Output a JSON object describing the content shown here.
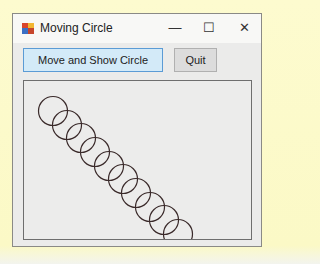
{
  "window": {
    "title": "Moving Circle",
    "controls": {
      "minimize": "—",
      "maximize": "☐",
      "close": "✕"
    }
  },
  "buttons": {
    "move_label": "Move and Show Circle",
    "quit_label": "Quit"
  },
  "canvas": {
    "circle_diameter": 29,
    "circle_color": "#3a2a2a",
    "circles": [
      {
        "cx": 29,
        "cy": 30
      },
      {
        "cx": 43,
        "cy": 44
      },
      {
        "cx": 57,
        "cy": 57
      },
      {
        "cx": 71,
        "cy": 71
      },
      {
        "cx": 85,
        "cy": 85
      },
      {
        "cx": 99,
        "cy": 98
      },
      {
        "cx": 112,
        "cy": 112
      },
      {
        "cx": 126,
        "cy": 126
      },
      {
        "cx": 140,
        "cy": 139
      },
      {
        "cx": 154,
        "cy": 153
      }
    ]
  }
}
